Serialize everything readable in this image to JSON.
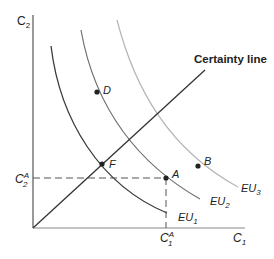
{
  "diagram": {
    "type": "expected-utility-indifference-curves",
    "axes": {
      "x_label": "C",
      "x_sub": "1",
      "y_label": "C",
      "y_sub": "2"
    },
    "certainty_line_label": "Certainty line",
    "curves": [
      {
        "name": "EU",
        "sub": "1",
        "color": "#3a3a3a"
      },
      {
        "name": "EU",
        "sub": "2",
        "color": "#6f6f6f"
      },
      {
        "name": "EU",
        "sub": "3",
        "color": "#b4b4b4"
      }
    ],
    "points": [
      {
        "label": "D"
      },
      {
        "label": "F"
      },
      {
        "label": "A"
      },
      {
        "label": "B"
      }
    ],
    "reference_ticks": {
      "x_tick": {
        "label": "C",
        "sub": "1",
        "sup": "A"
      },
      "y_tick": {
        "label": "C",
        "sub": "2",
        "sup": "A"
      }
    }
  }
}
